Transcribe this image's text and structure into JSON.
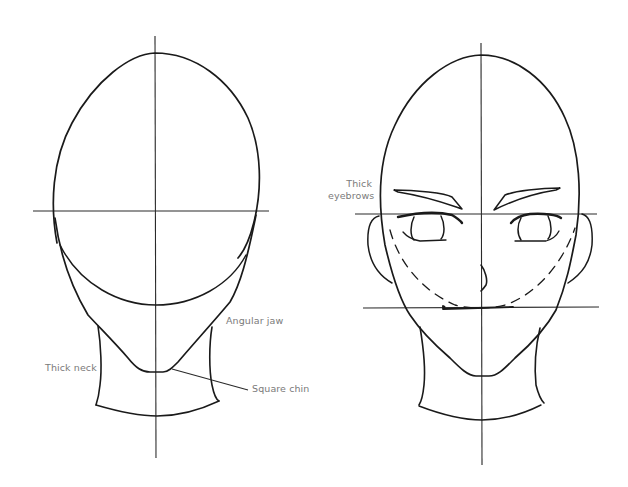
{
  "figure": {
    "background": "#ffffff",
    "line_color": "#1a1a1a",
    "label_color": "#7a7a7a"
  },
  "left_head": {
    "labels": {
      "angular_jaw": "Angular jaw",
      "thick_neck": "Thick neck",
      "square_chin": "Square chin"
    }
  },
  "right_head": {
    "labels": {
      "thick_eyebrows_line1": "Thick",
      "thick_eyebrows_line2": "eyebrows"
    }
  }
}
